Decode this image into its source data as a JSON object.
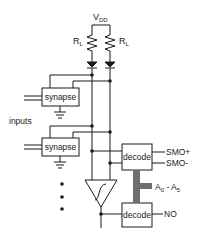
{
  "diagram": {
    "supply": {
      "label": "V",
      "subscript": "DD"
    },
    "resistors": [
      {
        "label": "R",
        "subscript": "L"
      },
      {
        "label": "R",
        "subscript": "L"
      }
    ],
    "synapses": [
      {
        "label": "synapse"
      },
      {
        "label": "synapse"
      }
    ],
    "inputs_label": "inputs",
    "decoders": [
      {
        "label": "decode",
        "outputs": [
          "SMO+",
          "SMO-"
        ]
      },
      {
        "label": "decode",
        "outputs": [
          "NO"
        ]
      }
    ],
    "bus": {
      "label": "A",
      "sub_start": "0",
      "sep": " - A",
      "sub_end": "5"
    },
    "ellipsis": "⋮",
    "colors": {
      "line": "#1a1a1a",
      "bus": "#6e6e6e",
      "background": "#ffffff"
    }
  }
}
